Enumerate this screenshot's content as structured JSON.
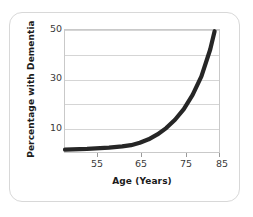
{
  "chart_data": {
    "type": "line",
    "title": "",
    "xlabel": "Age (Years)",
    "ylabel": "Percentage with Dementia",
    "xlim": [
      50,
      85
    ],
    "ylim": [
      0,
      50
    ],
    "xticks": [
      55,
      65,
      75,
      85
    ],
    "yticks": [
      10,
      30,
      50
    ],
    "gridlines_y": [
      10,
      20,
      30,
      40,
      50
    ],
    "grid": true,
    "legend": "none",
    "series": [
      {
        "name": "Percentage with Dementia",
        "color": "#262626",
        "x": [
          50,
          55,
          60,
          63,
          65,
          67,
          69,
          71,
          73,
          75,
          77,
          79,
          81,
          83,
          84
        ],
        "y": [
          1.0,
          1.3,
          1.8,
          2.3,
          2.8,
          3.8,
          5.2,
          7.2,
          9.8,
          13.2,
          17.6,
          23.4,
          31.0,
          42.0,
          49.5
        ]
      }
    ]
  },
  "axis": {
    "ylabel_text": "Percentage with Dementia",
    "xlabel_text": "Age (Years)",
    "ytick_labels": [
      "50",
      "30",
      "10"
    ],
    "xtick_labels": [
      "55",
      "65",
      "75",
      "85"
    ]
  },
  "colors": {
    "curve": "#262626",
    "gridline": "#d5d5d5",
    "plot_border": "#c9c9c9",
    "card_border": "#d8d8d8",
    "background": "#ffffff",
    "text": "#1b1b1b",
    "tick_text": "#3a3a3a"
  }
}
